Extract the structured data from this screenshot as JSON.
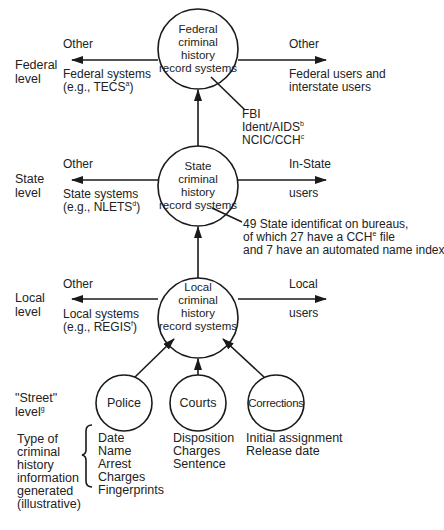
{
  "levels": {
    "federal": {
      "label_line1": "Federal",
      "label_line2": "level"
    },
    "state": {
      "label_line1": "State",
      "label_line2": "level"
    },
    "local": {
      "label_line1": "Local",
      "label_line2": "level"
    },
    "street": {
      "label_line1": "\"Street\"",
      "label_line2": "level",
      "footnote": "g"
    }
  },
  "nodes": {
    "federal": {
      "lines": [
        "Federal",
        "criminal",
        "history",
        "record systems"
      ]
    },
    "state": {
      "lines": [
        "State",
        "criminal",
        "history",
        "record systems"
      ]
    },
    "local": {
      "lines": [
        "Local",
        "criminal",
        "history",
        "record systems"
      ]
    },
    "police": {
      "label": "Police"
    },
    "courts": {
      "label": "Courts"
    },
    "corrections": {
      "label": "Corrections"
    }
  },
  "federal_row": {
    "left_top": "Other",
    "left_bottom_line1": "Federal systems",
    "left_bottom_line2_prefix": "(e.g., TECS",
    "left_bottom_footnote": "a",
    "left_bottom_line2_suffix": ")",
    "right_top": "Other",
    "right_bottom_line1": "Federal users and",
    "right_bottom_line2": "interstate users",
    "callout": [
      {
        "text": "FBI",
        "footnote": ""
      },
      {
        "text": "Ident/AIDS",
        "footnote": "b"
      },
      {
        "text": "NCIC/CCH",
        "footnote": "c"
      }
    ]
  },
  "state_row": {
    "left_top": "Other",
    "left_bottom_line1": "State systems",
    "left_bottom_line2_prefix": "(e.g., NLETS",
    "left_bottom_footnote": "d",
    "left_bottom_line2_suffix": ")",
    "right_top": "In-State",
    "right_bottom": "users",
    "callout_line1": "49 State identificat on bureaus,",
    "callout_line2_prefix": "of which 27 have a CCH",
    "callout_line2_footnote": "e",
    "callout_line2_suffix": " file",
    "callout_line3": "and 7 have an automated name index"
  },
  "local_row": {
    "left_top": "Other",
    "left_bottom_line1": "Local systems",
    "left_bottom_line2_prefix": "(e.g., REGIS",
    "left_bottom_footnote": "f",
    "left_bottom_line2_suffix": ")",
    "right_top": "Local",
    "right_bottom": "users"
  },
  "info_types": {
    "label_lines": [
      "Type of",
      "criminal",
      "history",
      "information",
      "generated",
      "(illustrative)"
    ],
    "police": [
      "Date",
      "Name",
      "Arrest",
      "Charges",
      "Fingerprints"
    ],
    "courts": [
      "Disposition",
      "Charges",
      "Sentence"
    ],
    "corrections": [
      "Initial assignment",
      "Release date"
    ]
  },
  "colors": {
    "line": "#1a1a1a",
    "text": "#222222",
    "background": "#ffffff"
  }
}
